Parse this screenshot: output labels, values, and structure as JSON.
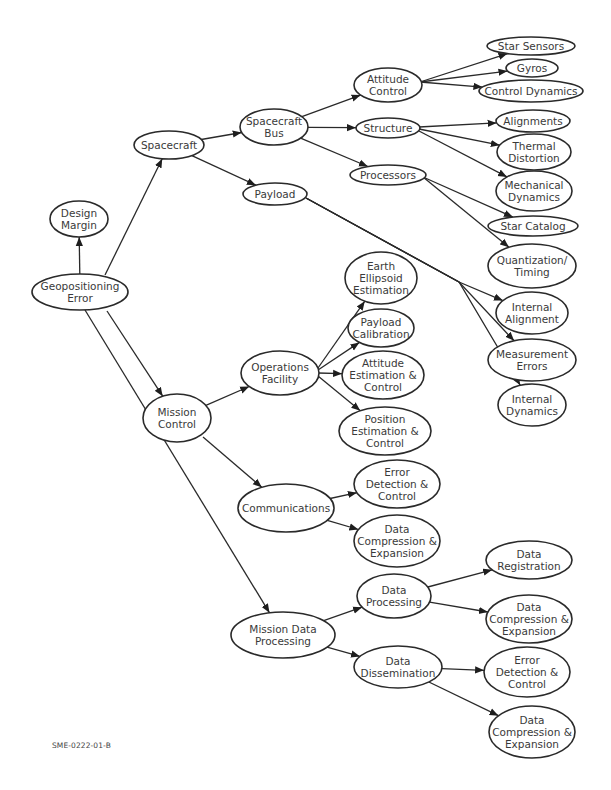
{
  "figure": {
    "code": "SME-0222-01-B",
    "root": "Geopositioning Error"
  },
  "colors": {
    "stroke": "#2a2a2a",
    "text": "#3a3a3a",
    "background": "#ffffff"
  },
  "nodes": [
    {
      "id": "geo",
      "lines": [
        "Geopositioning",
        "Error"
      ],
      "cx": 80,
      "cy": 292,
      "rx": 48,
      "ry": 18
    },
    {
      "id": "design",
      "lines": [
        "Design",
        "Margin"
      ],
      "cx": 79,
      "cy": 219,
      "rx": 29,
      "ry": 18
    },
    {
      "id": "spacecraft",
      "lines": [
        "Spacecraft"
      ],
      "cx": 169,
      "cy": 145,
      "rx": 35,
      "ry": 14
    },
    {
      "id": "bus",
      "lines": [
        "Spacecraft",
        "Bus"
      ],
      "cx": 274,
      "cy": 127,
      "rx": 34,
      "ry": 18
    },
    {
      "id": "payload",
      "lines": [
        "Payload"
      ],
      "cx": 275,
      "cy": 194,
      "rx": 32,
      "ry": 11
    },
    {
      "id": "attctl",
      "lines": [
        "Attitude",
        "Control"
      ],
      "cx": 388,
      "cy": 85,
      "rx": 34,
      "ry": 17
    },
    {
      "id": "structure",
      "lines": [
        "Structure"
      ],
      "cx": 388,
      "cy": 128,
      "rx": 32,
      "ry": 10
    },
    {
      "id": "processors",
      "lines": [
        "Processors"
      ],
      "cx": 388,
      "cy": 175,
      "rx": 38,
      "ry": 10
    },
    {
      "id": "starsens",
      "lines": [
        "Star Sensors"
      ],
      "cx": 531,
      "cy": 46,
      "rx": 44,
      "ry": 9
    },
    {
      "id": "gyros",
      "lines": [
        "Gyros"
      ],
      "cx": 532,
      "cy": 68,
      "rx": 26,
      "ry": 9
    },
    {
      "id": "ctldyn",
      "lines": [
        "Control Dynamics"
      ],
      "cx": 531,
      "cy": 91,
      "rx": 52,
      "ry": 11
    },
    {
      "id": "align",
      "lines": [
        "Alignments"
      ],
      "cx": 533,
      "cy": 121,
      "rx": 37,
      "ry": 11
    },
    {
      "id": "thermal",
      "lines": [
        "Thermal",
        "Distortion"
      ],
      "cx": 534,
      "cy": 152,
      "rx": 37,
      "ry": 18
    },
    {
      "id": "mechdyn",
      "lines": [
        "Mechanical",
        "Dynamics"
      ],
      "cx": 534,
      "cy": 191,
      "rx": 38,
      "ry": 20
    },
    {
      "id": "starcat",
      "lines": [
        "Star Catalog"
      ],
      "cx": 533,
      "cy": 226,
      "rx": 45,
      "ry": 10
    },
    {
      "id": "quant",
      "lines": [
        "Quantization/",
        "Timing"
      ],
      "cx": 532,
      "cy": 266,
      "rx": 44,
      "ry": 22
    },
    {
      "id": "earth",
      "lines": [
        "Earth",
        "Ellipsoid",
        "Estimation"
      ],
      "cx": 381,
      "cy": 278,
      "rx": 36,
      "ry": 26
    },
    {
      "id": "intalign",
      "lines": [
        "Internal",
        "Alignment"
      ],
      "cx": 532,
      "cy": 313,
      "rx": 36,
      "ry": 21
    },
    {
      "id": "paycal",
      "lines": [
        "Payload",
        "Calibration"
      ],
      "cx": 381,
      "cy": 328,
      "rx": 33,
      "ry": 19
    },
    {
      "id": "ops",
      "lines": [
        "Operations",
        "Facility"
      ],
      "cx": 280,
      "cy": 373,
      "rx": 39,
      "ry": 22
    },
    {
      "id": "measerr",
      "lines": [
        "Measurement",
        "Errors"
      ],
      "cx": 532,
      "cy": 360,
      "rx": 44,
      "ry": 21
    },
    {
      "id": "attest",
      "lines": [
        "Attitude",
        "Estimation &",
        "Control"
      ],
      "cx": 383,
      "cy": 375,
      "rx": 41,
      "ry": 24
    },
    {
      "id": "intdyn",
      "lines": [
        "Internal",
        "Dynamics"
      ],
      "cx": 532,
      "cy": 405,
      "rx": 34,
      "ry": 21
    },
    {
      "id": "mission",
      "lines": [
        "Mission",
        "Control"
      ],
      "cx": 177,
      "cy": 418,
      "rx": 34,
      "ry": 24
    },
    {
      "id": "posest",
      "lines": [
        "Position",
        "Estimation &",
        "Control"
      ],
      "cx": 385,
      "cy": 431,
      "rx": 46,
      "ry": 24
    },
    {
      "id": "comm_err",
      "lines": [
        "Error",
        "Detection &",
        "Control"
      ],
      "cx": 397,
      "cy": 484,
      "rx": 43,
      "ry": 24
    },
    {
      "id": "comm",
      "lines": [
        "Communications"
      ],
      "cx": 286,
      "cy": 508,
      "rx": 48,
      "ry": 24
    },
    {
      "id": "comm_dce",
      "lines": [
        "Data",
        "Compression &",
        "Expansion"
      ],
      "cx": 397,
      "cy": 541,
      "rx": 43,
      "ry": 26
    },
    {
      "id": "datareg",
      "lines": [
        "Data",
        "Registration"
      ],
      "cx": 529,
      "cy": 560,
      "rx": 43,
      "ry": 19
    },
    {
      "id": "dataproc",
      "lines": [
        "Data",
        "Processing"
      ],
      "cx": 394,
      "cy": 596,
      "rx": 37,
      "ry": 22
    },
    {
      "id": "mdp",
      "lines": [
        "Mission Data",
        "Processing"
      ],
      "cx": 283,
      "cy": 635,
      "rx": 52,
      "ry": 23
    },
    {
      "id": "proc_dce",
      "lines": [
        "Data",
        "Compression &",
        "Expansion"
      ],
      "cx": 529,
      "cy": 619,
      "rx": 43,
      "ry": 24
    },
    {
      "id": "dissem",
      "lines": [
        "Data",
        "Dissemination"
      ],
      "cx": 398,
      "cy": 667,
      "rx": 44,
      "ry": 21
    },
    {
      "id": "dissem_err",
      "lines": [
        "Error",
        "Detection &",
        "Control"
      ],
      "cx": 527,
      "cy": 672,
      "rx": 43,
      "ry": 25
    },
    {
      "id": "dissem_dce",
      "lines": [
        "Data",
        "Compression &",
        "Expansion"
      ],
      "cx": 532,
      "cy": 732,
      "rx": 43,
      "ry": 26
    }
  ],
  "edges": [
    {
      "from": "geo",
      "to": "design"
    },
    {
      "from": "geo",
      "to": "spacecraft",
      "fx": 105,
      "fy": 275
    },
    {
      "from": "geo",
      "to": "mission",
      "fx": 107,
      "fy": 311
    },
    {
      "from": "geo",
      "to": "mdp",
      "fx": 85,
      "fy": 310
    },
    {
      "from": "spacecraft",
      "to": "bus"
    },
    {
      "from": "spacecraft",
      "to": "payload"
    },
    {
      "from": "bus",
      "to": "attctl"
    },
    {
      "from": "bus",
      "to": "structure"
    },
    {
      "from": "bus",
      "to": "processors"
    },
    {
      "from": "attctl",
      "to": "starsens",
      "fx": 420,
      "fy": 82
    },
    {
      "from": "attctl",
      "to": "gyros",
      "fx": 420,
      "fy": 82
    },
    {
      "from": "attctl",
      "to": "ctldyn",
      "fx": 420,
      "fy": 82
    },
    {
      "from": "structure",
      "to": "align",
      "fx": 419,
      "fy": 127
    },
    {
      "from": "structure",
      "to": "thermal",
      "fx": 419,
      "fy": 129
    },
    {
      "from": "structure",
      "to": "mechdyn",
      "fx": 419,
      "fy": 131
    },
    {
      "from": "processors",
      "to": "starcat",
      "fx": 423,
      "fy": 177
    },
    {
      "from": "processors",
      "to": "quant",
      "fx": 423,
      "fy": 177
    },
    {
      "from": "payload",
      "to": "intalign",
      "fx": 306,
      "fy": 198,
      "via": [
        459,
        282
      ]
    },
    {
      "from": "payload",
      "to": "measerr",
      "fx": 306,
      "fy": 198,
      "via": [
        459,
        282
      ]
    },
    {
      "from": "payload",
      "to": "intdyn",
      "fx": 306,
      "fy": 198,
      "via": [
        459,
        282
      ]
    },
    {
      "from": "mission",
      "to": "ops"
    },
    {
      "from": "mission",
      "to": "comm",
      "fx": 203,
      "fy": 437
    },
    {
      "from": "ops",
      "to": "earth",
      "fx": 318,
      "fy": 368
    },
    {
      "from": "ops",
      "to": "paycal",
      "fx": 318,
      "fy": 370
    },
    {
      "from": "ops",
      "to": "attest",
      "fx": 318,
      "fy": 373
    },
    {
      "from": "ops",
      "to": "posest",
      "fx": 318,
      "fy": 376
    },
    {
      "from": "comm",
      "to": "comm_err"
    },
    {
      "from": "comm",
      "to": "comm_dce"
    },
    {
      "from": "mdp",
      "to": "dataproc"
    },
    {
      "from": "mdp",
      "to": "dissem"
    },
    {
      "from": "dataproc",
      "to": "datareg"
    },
    {
      "from": "dataproc",
      "to": "proc_dce"
    },
    {
      "from": "dissem",
      "to": "dissem_err"
    },
    {
      "from": "dissem",
      "to": "dissem_dce"
    }
  ]
}
